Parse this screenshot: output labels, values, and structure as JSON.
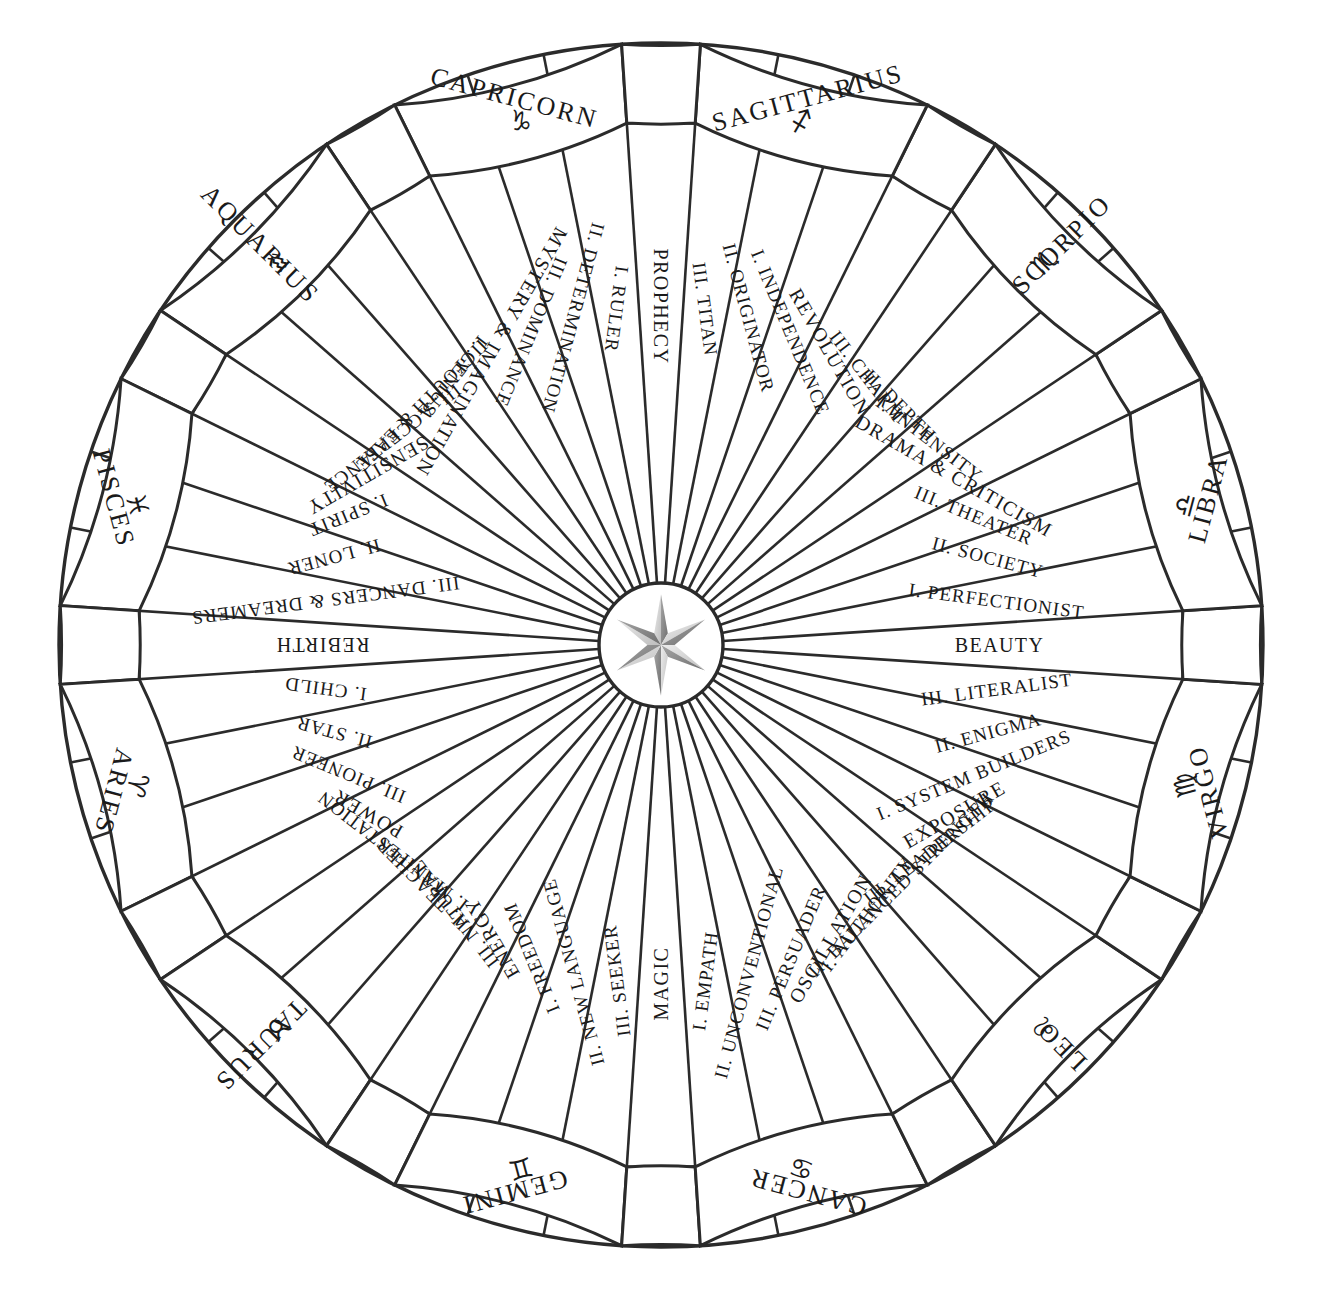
{
  "diagram": {
    "geometry": {
      "center_x": 661,
      "center_y": 645,
      "outer_radius": 602,
      "sign_ring_inner_radius": 523,
      "hub_radius": 62,
      "segment_count": 48,
      "start_angle_deg": -90,
      "direction": "counterclockwise"
    },
    "colors": {
      "stroke": "#2b2b2b",
      "background": "#ffffff",
      "text": "#1a1a1a",
      "star_light": "#d8d8d8",
      "star_dark": "#8b8b8b"
    },
    "hub": {
      "icon": "compass-rose-star",
      "points": 6
    },
    "signs": [
      {
        "name": "CAPRICORN",
        "glyph": "♑",
        "decans": [
          "I. RULER",
          "II. DETERMINATION",
          "III. DOMINANCE"
        ],
        "cusp_after": "MYSTERY & IMAGINATION"
      },
      {
        "name": "AQUARIUS",
        "glyph": "♒",
        "decans": [
          "I. GENIUS",
          "II. YOUTH & EASE",
          "III. ACCEPTANCE"
        ],
        "cusp_after": "SENSITIVITY"
      },
      {
        "name": "PISCES",
        "glyph": "♓",
        "decans": [
          "I. SPIRIT",
          "II. LONER",
          "III. DANCERS & DREAMERS"
        ],
        "cusp_after": "REBIRTH"
      },
      {
        "name": "ARIES",
        "glyph": "♈",
        "decans": [
          "I. CHILD",
          "II. STAR",
          "III. PIONEER"
        ],
        "cusp_after": "POWER"
      },
      {
        "name": "TAURUS",
        "glyph": "♉",
        "decans": [
          "I. MANIFESTATION",
          "II. TEACHER",
          "III. NATURAL"
        ],
        "cusp_after": "ENERGY"
      },
      {
        "name": "GEMINI",
        "glyph": "♊",
        "decans": [
          "I. FREEDOM",
          "II. NEW LANGUAGE",
          "III. SEEKER"
        ],
        "cusp_after": "MAGIC"
      },
      {
        "name": "CANCER",
        "glyph": "♋",
        "decans": [
          "I. EMPATH",
          "II. UNCONVENTIONAL",
          "III. PERSUADER"
        ],
        "cusp_after": "OSCILLATION"
      },
      {
        "name": "LEO",
        "glyph": "♌",
        "decans": [
          "I. AUTHORITY",
          "II. BALANCED STRENGTH",
          "III. LEADERSHIP"
        ],
        "cusp_after": "EXPOSURE"
      },
      {
        "name": "VIRGO",
        "glyph": "♍",
        "decans": [
          "I. SYSTEM BUILDERS",
          "II. ENIGMA",
          "III. LITERALIST"
        ],
        "cusp_after": "BEAUTY"
      },
      {
        "name": "LIBRA",
        "glyph": "♎",
        "decans": [
          "I. PERFECTIONIST",
          "II. SOCIETY",
          "III. THEATER"
        ],
        "cusp_after": "DRAMA & CRITICISM"
      },
      {
        "name": "SCORPIO",
        "glyph": "♏",
        "decans": [
          "I. INTENSITY",
          "II. DEPTH",
          "III. CHARM"
        ],
        "cusp_after": "REVOLUTION"
      },
      {
        "name": "SAGITTARIUS",
        "glyph": "♐",
        "decans": [
          "I. INDEPENDENCE",
          "II. ORIGINATOR",
          "III. TITAN"
        ],
        "cusp_after": "PROPHECY"
      }
    ]
  }
}
